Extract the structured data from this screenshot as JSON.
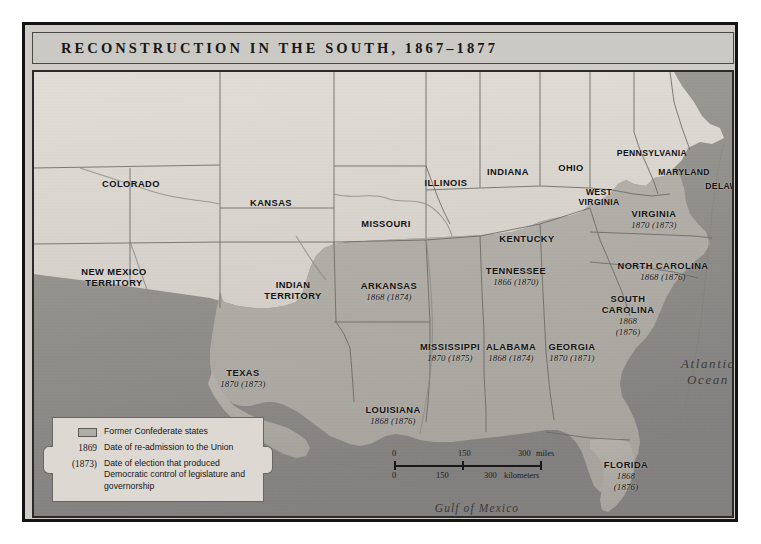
{
  "title": "RECONSTRUCTION IN THE SOUTH, 1867–1877",
  "water_labels": [
    {
      "name": "atlantic-ocean",
      "line1": "Atlantic",
      "line2": "Ocean",
      "x": 674,
      "y": 300
    },
    {
      "name": "gulf-of-mexico",
      "line1": "Gulf of Mexico",
      "line2": "",
      "x": 443,
      "y": 436
    }
  ],
  "confederate_states": [
    {
      "name": "virginia",
      "label": "VIRGINIA",
      "label2": "",
      "year": "1870 (1873)",
      "x": 620,
      "y": 148
    },
    {
      "name": "north-carolina",
      "label": "NORTH CAROLINA",
      "label2": "",
      "year": "1868 (1876)",
      "x": 629,
      "y": 200
    },
    {
      "name": "south-carolina",
      "label": "SOUTH",
      "label2": "CAROLINA",
      "year": "1868",
      "year2": "(1876)",
      "x": 594,
      "y": 244
    },
    {
      "name": "georgia",
      "label": "GEORGIA",
      "label2": "",
      "year": "1870 (1871)",
      "x": 538,
      "y": 281
    },
    {
      "name": "florida",
      "label": "FLORIDA",
      "label2": "",
      "year": "1868",
      "year2": "(1876)",
      "x": 592,
      "y": 404
    },
    {
      "name": "alabama",
      "label": "ALABAMA",
      "label2": "",
      "year": "1868 (1874)",
      "x": 477,
      "y": 281
    },
    {
      "name": "mississippi",
      "label": "MISSISSIPPI",
      "label2": "",
      "year": "1870 (1875)",
      "x": 416,
      "y": 281
    },
    {
      "name": "tennessee",
      "label": "TENNESSEE",
      "label2": "",
      "year": "1866 (1870)",
      "x": 482,
      "y": 205
    },
    {
      "name": "arkansas",
      "label": "ARKANSAS",
      "label2": "",
      "year": "1868 (1874)",
      "x": 355,
      "y": 220
    },
    {
      "name": "louisiana",
      "label": "LOUISIANA",
      "label2": "",
      "year": "1868 (1876)",
      "x": 359,
      "y": 344
    },
    {
      "name": "texas",
      "label": "TEXAS",
      "label2": "",
      "year": "1870 (1873)",
      "x": 209,
      "y": 307
    }
  ],
  "other_places": [
    {
      "name": "colorado",
      "label": "COLORADO",
      "label2": "",
      "x": 97,
      "y": 112
    },
    {
      "name": "kansas",
      "label": "KANSAS",
      "label2": "",
      "x": 237,
      "y": 131
    },
    {
      "name": "new-mexico-territory",
      "label": "NEW MEXICO",
      "label2": "TERRITORY",
      "x": 80,
      "y": 206
    },
    {
      "name": "indian-territory",
      "label": "INDIAN",
      "label2": "TERRITORY",
      "x": 259,
      "y": 219
    },
    {
      "name": "missouri",
      "label": "MISSOURI",
      "label2": "",
      "x": 352,
      "y": 152
    },
    {
      "name": "illinois",
      "label": "ILLINOIS",
      "label2": "",
      "x": 412,
      "y": 111
    },
    {
      "name": "indiana",
      "label": "INDIANA",
      "label2": "",
      "x": 474,
      "y": 100
    },
    {
      "name": "ohio",
      "label": "OHIO",
      "label2": "",
      "x": 537,
      "y": 96
    },
    {
      "name": "kentucky",
      "label": "KENTUCKY",
      "label2": "",
      "x": 493,
      "y": 167
    },
    {
      "name": "west-virginia",
      "label": "WEST",
      "label2": "VIRGINIA",
      "x": 565,
      "y": 125
    },
    {
      "name": "pennsylvania",
      "label": "PENNSYLVANIA",
      "label2": "",
      "x": 618,
      "y": 81
    },
    {
      "name": "maryland",
      "label": "MARYLAND",
      "label2": "",
      "x": 650,
      "y": 100
    },
    {
      "name": "delaware",
      "label": "DELAWARE",
      "label2": "",
      "x": 697,
      "y": 114
    }
  ],
  "legend": {
    "rows": [
      {
        "name": "former-confederate-states",
        "key_type": "swatch",
        "key": "",
        "desc": "Former Confederate states"
      },
      {
        "name": "readmission-date",
        "key_type": "text",
        "key": "1869",
        "desc": "Date of re-admission to the Union"
      },
      {
        "name": "democratic-control-date",
        "key_type": "text",
        "key": "(1873)",
        "desc": "Date of election that produced Democratic control of legislature and governorship"
      }
    ]
  },
  "scalebar": {
    "miles_unit": "miles",
    "km_unit": "kilometers",
    "miles_ticks": [
      "0",
      "150",
      "300"
    ],
    "km_ticks": [
      "0",
      "150",
      "300"
    ]
  },
  "colors": {
    "confederate_fill": "#b0ada6",
    "union_fill": "#ded9d2",
    "water": "#94928d",
    "frame": "#141414"
  }
}
